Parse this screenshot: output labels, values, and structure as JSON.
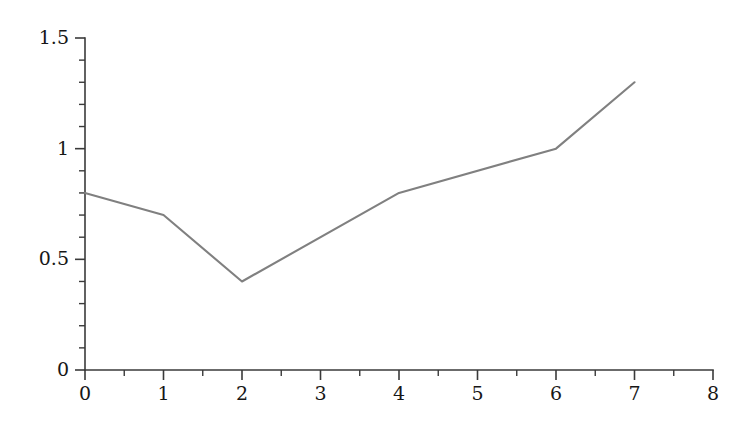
{
  "chart_data": {
    "type": "line",
    "title": "",
    "subtitle": "",
    "xlabel": "",
    "ylabel": "",
    "x": [
      0,
      1,
      2,
      4,
      6,
      7
    ],
    "values": [
      0.8,
      0.7,
      0.4,
      0.8,
      1.0,
      1.3
    ],
    "series": [
      {
        "name": "series-1",
        "x": [
          0,
          1,
          2,
          4,
          6,
          7
        ],
        "values": [
          0.8,
          0.7,
          0.4,
          0.8,
          1.0,
          1.3
        ],
        "color": "#808080"
      }
    ],
    "xlim": [
      0,
      8
    ],
    "ylim": [
      0,
      1.5
    ],
    "x_ticks": [
      0,
      1,
      2,
      3,
      4,
      5,
      6,
      7,
      8
    ],
    "x_tick_labels": [
      "0",
      "1",
      "2",
      "3",
      "4",
      "5",
      "6",
      "7",
      "8"
    ],
    "x_minor_step": 0.5,
    "y_ticks": [
      0,
      0.5,
      1,
      1.5
    ],
    "y_tick_labels": [
      "0",
      "0.5",
      "1",
      "1.5"
    ],
    "y_minor_step": 0.1,
    "grid": false,
    "legend": false,
    "legend_position": "none",
    "annotations": [],
    "background_color": "#ffffff",
    "axis_color": "#3a3a3a",
    "line_color": "#808080"
  }
}
